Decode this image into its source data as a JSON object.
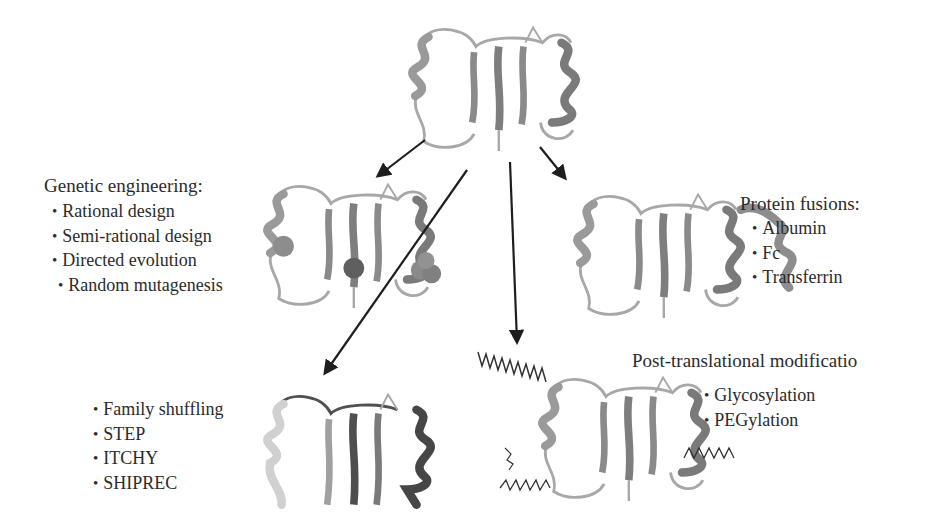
{
  "figure": {
    "center_protein": {
      "name": "wild-type protein structure"
    },
    "genetic_engineering": {
      "heading": "Genetic engineering:",
      "items": [
        "Rational design",
        "Semi-rational design",
        "Directed evolution"
      ],
      "sub_items": [
        "Random mutagenesis"
      ]
    },
    "recombination": {
      "items": [
        "Family shuffling",
        "STEP",
        "ITCHY",
        "SHIPREC"
      ]
    },
    "protein_fusions": {
      "heading": "Protein fusions:",
      "items": [
        "Albumin",
        "Fc",
        "Transferrin"
      ]
    },
    "post_translational": {
      "heading": "Post-translational modificatio",
      "items": [
        "Glycosylation",
        "PEGylation"
      ]
    },
    "colors": {
      "arrow": "#1e1e1e",
      "ribbon_light": "#b5b5b5",
      "ribbon_mid": "#8c8c8c",
      "ribbon_dark": "#5e5e5e",
      "text": "#2b2b2b"
    }
  }
}
